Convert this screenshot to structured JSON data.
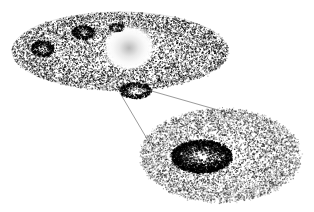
{
  "figure": {
    "title": "Simulated galactic disk with magnified substructure inset",
    "background_color": "#ffffff",
    "point_color": "#000000",
    "line_color": "#555555",
    "width": 314,
    "height": 212
  },
  "main_disk": {
    "label": "galactic-disk",
    "center_x": 120,
    "center_y": 51,
    "radius_x": 108,
    "radius_y": 39,
    "rim_outline": true,
    "inner_ring": {
      "label": "inner-ring",
      "center_x": 120,
      "center_y": 57,
      "radius_x": 92,
      "radius_y": 29
    },
    "point_count": 9000,
    "edge_softness": 0.22
  },
  "bulge": {
    "label": "central-bulge",
    "center_x": 129,
    "center_y": 48,
    "radius": 23,
    "core_color": "#b9b9b9",
    "glow_color": "#ffffff",
    "description": "bright white radial glow with faint gray core"
  },
  "clumps": [
    {
      "name": "clump-upper-left",
      "cx": 42,
      "cy": 48,
      "rx": 11,
      "ry": 8,
      "darkness": 0.8,
      "n": 420
    },
    {
      "name": "clump-upper-mid",
      "cx": 83,
      "cy": 32,
      "rx": 11,
      "ry": 7,
      "darkness": 0.78,
      "n": 400
    },
    {
      "name": "clump-upper-right",
      "cx": 116,
      "cy": 27,
      "rx": 7,
      "ry": 4,
      "darkness": 0.45,
      "n": 150
    },
    {
      "name": "clump-magnified",
      "cx": 135,
      "cy": 90,
      "rx": 16,
      "ry": 8,
      "darkness": 0.88,
      "n": 520
    }
  ],
  "inset": {
    "label": "magnified-subhalo-inset",
    "center_x": 220,
    "center_y": 155,
    "radius_x": 80,
    "radius_y": 47,
    "point_count": 7000,
    "core": {
      "label": "inset-dense-core",
      "center_x": 201,
      "center_y": 156,
      "radius_x": 30,
      "radius_y": 16,
      "point_count": 2600
    }
  },
  "leader_lines": [
    {
      "name": "leader-line-upper",
      "x1": 141,
      "y1": 88,
      "x2": 232,
      "y2": 114
    },
    {
      "name": "leader-line-lower",
      "x1": 120,
      "y1": 93,
      "x2": 153,
      "y2": 149
    }
  ]
}
